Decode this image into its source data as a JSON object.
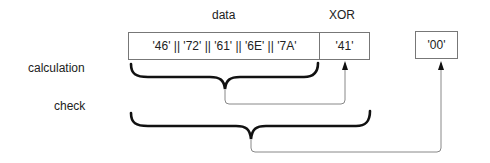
{
  "headers": {
    "data": "data",
    "xor": "XOR"
  },
  "row_labels": {
    "calculation": "calculation",
    "check": "check"
  },
  "boxes": {
    "data_sequence": "'46' || '72' || '61' || '6E' || '7A'",
    "xor_value": "'41'",
    "check_result": "'00'"
  },
  "connections": [
    {
      "from": "calculation-brace (data bytes)",
      "to": "xor_value",
      "style": "arrow"
    },
    {
      "from": "check-brace (data bytes + XOR)",
      "to": "check_result",
      "style": "arrow"
    }
  ],
  "colors": {
    "brace": "#111111",
    "connector": "#888888",
    "box_border": "#777777",
    "text": "#222222"
  }
}
